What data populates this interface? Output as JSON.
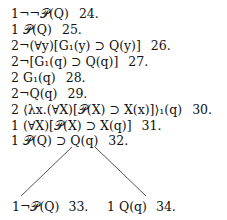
{
  "tableau": {
    "lines": [
      {
        "formula": "1¬¬𝒫(Q)",
        "number": "24."
      },
      {
        "formula": "1  𝒫(Q)",
        "number": "25."
      },
      {
        "formula": "2¬(∀y)[G₁(y) ⊃ Q(y)]",
        "number": "26."
      },
      {
        "formula": "2¬[G₁(q) ⊃ Q(q)]",
        "number": "27."
      },
      {
        "formula": "2  G₁(q)",
        "number": "28."
      },
      {
        "formula": "2¬Q(q)",
        "number": "29."
      },
      {
        "formula": "2  ⟨λx.(∀X)[𝒫(X) ⊃ X(x)]⟩₁(q)",
        "number": "30."
      },
      {
        "formula": "1  (∀X)[𝒫(X) ⊃ X(q)]",
        "number": "31."
      },
      {
        "formula": "1  𝒫(Q) ⊃ Q(q)",
        "number": "32."
      }
    ],
    "branches": {
      "left": {
        "formula": "1¬𝒫(Q)",
        "number": "33."
      },
      "right": {
        "formula": "1 Q(q)",
        "number": "34."
      }
    }
  }
}
